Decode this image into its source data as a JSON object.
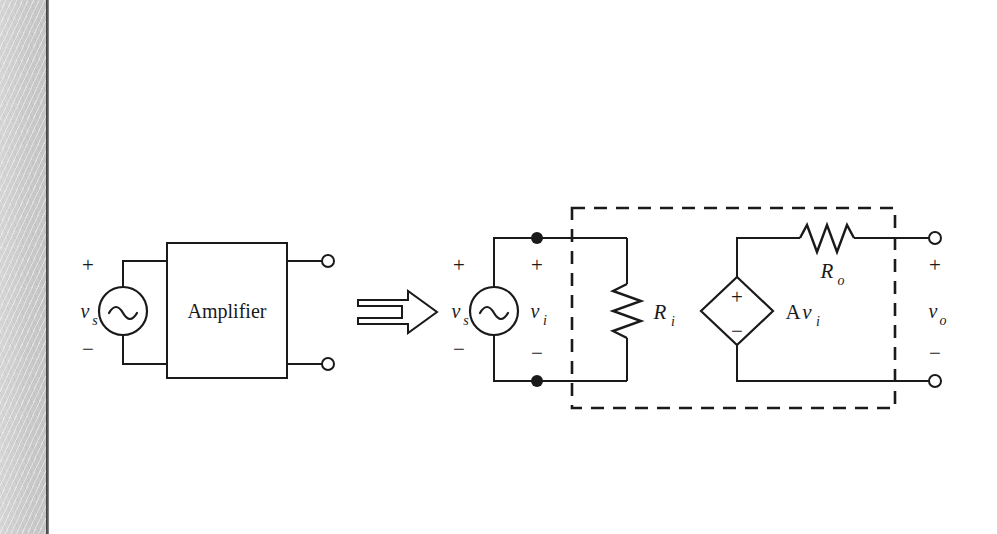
{
  "page": {
    "background_color": "#ffffff",
    "gutter_color": "#cbcbcb",
    "ink_color": "#1a1a1a",
    "width": 997,
    "height": 534
  },
  "figure": {
    "kind": "circuit-diagram",
    "transform_arrow": "=>"
  },
  "left_circuit": {
    "name": "amplifier-block-diagram",
    "source": {
      "type": "ac-voltage-source",
      "symbol": "sine",
      "label": "v",
      "subscript": "s",
      "plus": "+",
      "minus": "−"
    },
    "block": {
      "label": "Amplifier"
    },
    "terminals": {
      "top": "output-terminal-top",
      "bottom": "output-terminal-bottom",
      "style": "open-circle"
    }
  },
  "right_circuit": {
    "name": "amplifier-equivalent-model",
    "source": {
      "type": "ac-voltage-source",
      "symbol": "sine",
      "label": "v",
      "subscript": "s",
      "plus": "+",
      "minus": "−"
    },
    "input_port": {
      "label": "v",
      "subscript": "i",
      "plus": "+",
      "minus": "−",
      "node_dots": 2
    },
    "input_resistor": {
      "type": "resistor",
      "orientation": "vertical",
      "label": "R",
      "subscript": "i"
    },
    "dependent_source": {
      "type": "voltage-controlled-voltage-source",
      "shape": "diamond",
      "plus": "+",
      "minus": "−",
      "label_prefix": "A",
      "label": "v",
      "subscript": "i",
      "full_label": "Av_i"
    },
    "output_resistor": {
      "type": "resistor",
      "orientation": "horizontal",
      "label": "R",
      "subscript": "o"
    },
    "output_port": {
      "label": "v",
      "subscript": "o",
      "plus": "+",
      "minus": "−",
      "terminal_style": "open-circle"
    },
    "model_boundary": {
      "style": "dashed",
      "meaning": "amplifier-model-boundary"
    }
  }
}
